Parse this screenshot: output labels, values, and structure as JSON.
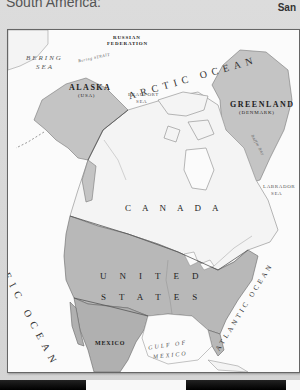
{
  "header": {
    "left_text": "South America:",
    "right_text": "San"
  },
  "map": {
    "countries": {
      "russia": "RUSSIAN",
      "russia_line2": "FEDERATION",
      "alaska": "ALASKA",
      "alaska_sub": "(USA)",
      "greenland": "GREENLAND",
      "greenland_sub": "(DENMARK)",
      "canada": "CANADA",
      "united": "UNITED",
      "states": "STATES",
      "mexico": "MEXICO"
    },
    "water": {
      "bering_sea_1": "BERING",
      "bering_sea_2": "SEA",
      "bering_strait": "Bering STRAIT",
      "arctic_ocean": "ARCTIC OCEAN",
      "beaufort_sea_1": "BEAUFORT",
      "beaufort_sea_2": "SEA",
      "baffin_bay": "Baffin Bay",
      "labrador_sea_1": "LABRADOR",
      "labrador_sea_2": "SEA",
      "pacific_ocean": "PACIFIC OCEAN",
      "atlantic_ocean": "ATLANTIC OCEAN",
      "gulf_1": "GULF OF",
      "gulf_2": "MEXICO"
    },
    "colors": {
      "land_us_mexico": "#b8b8b8",
      "land_alaska_greenland": "#c4c4c4",
      "land_canada": "#f4f4f4",
      "water": "#fbfbfb",
      "border": "#666666"
    }
  }
}
